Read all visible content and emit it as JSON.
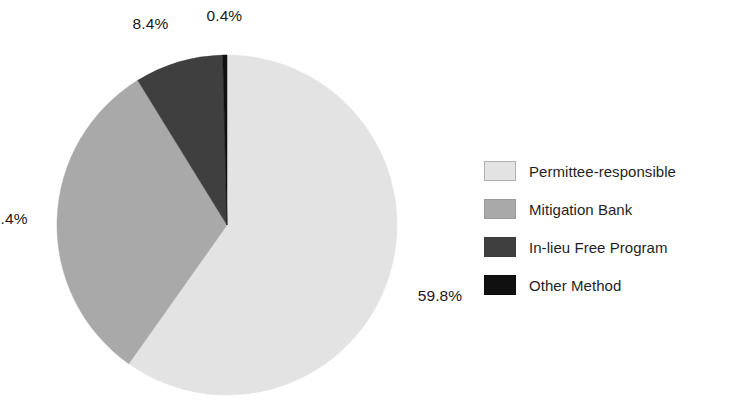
{
  "chart_data": {
    "type": "pie",
    "title": "",
    "subtitle": "",
    "xlabel": "",
    "ylabel": "",
    "grid": false,
    "legend_position": "right",
    "unit": "%",
    "start_angle_deg": 0,
    "direction": "clockwise",
    "categories": [
      "Permittee-responsible",
      "Mitigation Bank",
      "In-lieu Free Program",
      "Other Method"
    ],
    "values": [
      59.8,
      31.4,
      8.4,
      0.4
    ],
    "data_labels": [
      "59.8%",
      "31.4%",
      "8.4%",
      "0.4%"
    ],
    "colors": [
      "#e3e3e3",
      "#a9a9a9",
      "#3f3f3f",
      "#101010"
    ],
    "slices": [
      {
        "name": "Permittee-responsible",
        "value": 59.8,
        "label": "59.8%",
        "color": "#e3e3e3",
        "swatch_border": "#b0b0b0"
      },
      {
        "name": "Mitigation Bank",
        "value": 31.4,
        "label": "31.4%",
        "color": "#a9a9a9",
        "swatch_border": "#9a9a9a"
      },
      {
        "name": "In-lieu Free Program",
        "value": 8.4,
        "label": "8.4%",
        "color": "#3f3f3f",
        "swatch_border": "#3a3a3a"
      },
      {
        "name": "Other Method",
        "value": 0.4,
        "label": "0.4%",
        "color": "#101010",
        "swatch_border": "#0c0c0c"
      }
    ]
  },
  "legend": {
    "items": [
      {
        "label": "Permittee-responsible",
        "color": "#e3e3e3"
      },
      {
        "label": "Mitigation Bank",
        "color": "#a9a9a9"
      },
      {
        "label": "In-lieu Free Program",
        "color": "#3f3f3f"
      },
      {
        "label": "Other Method",
        "color": "#101010"
      }
    ]
  },
  "geometry": {
    "center_x": 227,
    "center_y": 225,
    "radius": 170
  }
}
